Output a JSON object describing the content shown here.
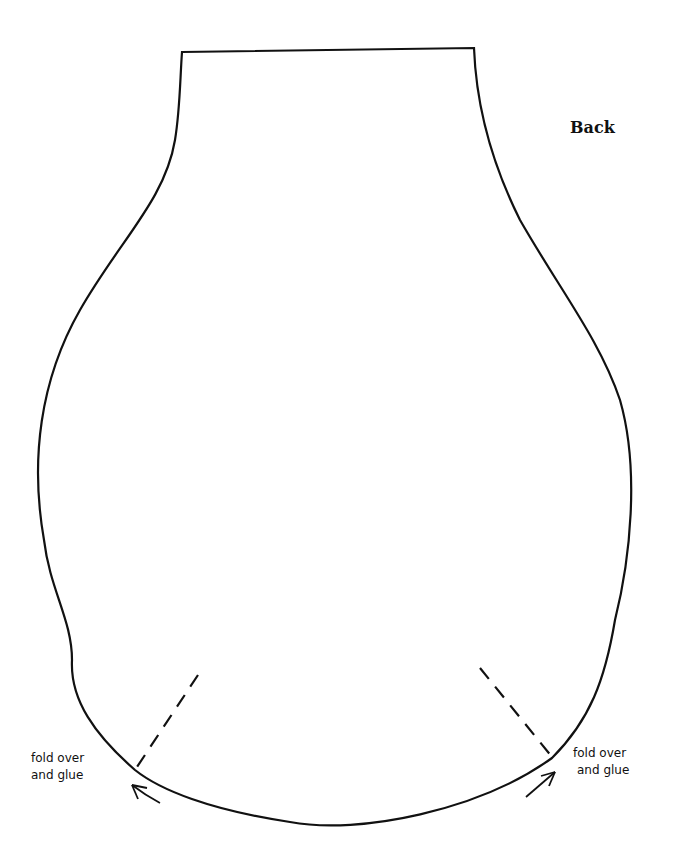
{
  "diagram": {
    "title": "Back",
    "annotations": [
      {
        "line1": "fold over",
        "line2": "and glue",
        "side": "left"
      },
      {
        "line1": "fold over",
        "line2": "and glue",
        "side": "right"
      }
    ],
    "stroke_color": "#111111",
    "background": "#ffffff"
  }
}
